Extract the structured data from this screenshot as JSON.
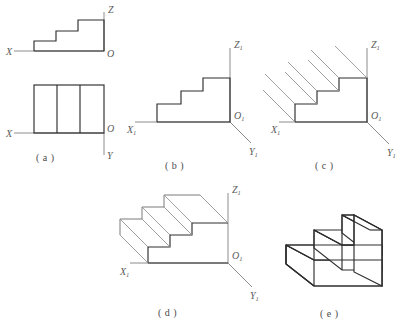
{
  "figure": {
    "background_color": "#ffffff",
    "object_line_color": "#2e2e2e",
    "axis_line_color": "#8c8c8c",
    "projection_line_color": "#8f8f8f",
    "label_color": "#5a5a5a"
  },
  "panels": [
    {
      "id": "a",
      "caption": "( a )",
      "description": "Orthographic two-view drawing: front view (stepped profile) above, top view (rectangle with two internal vertical lines) below",
      "axis_labels": [
        {
          "name": "x-axis-label",
          "text": "X",
          "subscript": ""
        },
        {
          "name": "z-axis-label",
          "text": "Z",
          "subscript": ""
        },
        {
          "name": "origin-label-front",
          "text": "O",
          "subscript": ""
        },
        {
          "name": "origin-label-top",
          "text": "O",
          "subscript": ""
        },
        {
          "name": "y-axis-label",
          "text": "Y",
          "subscript": ""
        }
      ],
      "views": [
        {
          "name": "front-view",
          "shape": "three-step staircase profile",
          "steps": 3
        },
        {
          "name": "top-view",
          "shape": "rectangle",
          "internal_divisions": 2,
          "panels": 3
        }
      ]
    },
    {
      "id": "b",
      "caption": "( b )",
      "description": "Stepped profile placed on the axonometric axis system X1-O1-Y1-Z1",
      "axis_labels": [
        {
          "name": "x1-axis-label",
          "text": "X",
          "subscript": "1"
        },
        {
          "name": "z1-axis-label",
          "text": "Z",
          "subscript": "1"
        },
        {
          "name": "origin1-label",
          "text": "O",
          "subscript": "1"
        },
        {
          "name": "y1-axis-label",
          "text": "Y",
          "subscript": "1"
        }
      ],
      "steps": 3
    },
    {
      "id": "c",
      "caption": "( c )",
      "description": "Parallel projection lines drawn from each vertex of the stepped profile along the depth direction",
      "axis_labels": [
        {
          "name": "x1-axis-label",
          "text": "X",
          "subscript": "1"
        },
        {
          "name": "z1-axis-label",
          "text": "Z",
          "subscript": "1"
        },
        {
          "name": "origin1-label",
          "text": "O",
          "subscript": "1"
        },
        {
          "name": "y1-axis-label",
          "text": "Y",
          "subscript": "1"
        }
      ],
      "projection_line_count": 7,
      "projection_angle_deg": 45
    },
    {
      "id": "d",
      "caption": "( d )",
      "description": "Rear stepped profile completed and connected to the front profile forming the full wireframe",
      "axis_labels": [
        {
          "name": "x1-axis-label",
          "text": "X",
          "subscript": "1"
        },
        {
          "name": "z1-axis-label",
          "text": "Z",
          "subscript": "1"
        },
        {
          "name": "origin1-label",
          "text": "O",
          "subscript": "1"
        },
        {
          "name": "y1-axis-label",
          "text": "Y",
          "subscript": "1"
        }
      ],
      "steps": 3
    },
    {
      "id": "e",
      "caption": "( e )",
      "description": "Finished axonometric solid with hidden lines and construction lines removed",
      "axis_labels": [],
      "steps": 3
    }
  ]
}
